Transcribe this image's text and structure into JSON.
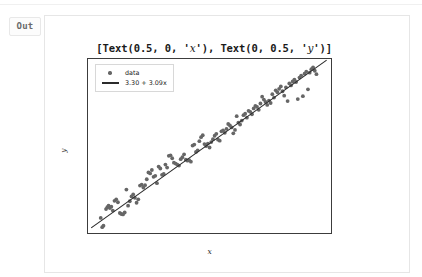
{
  "notebook": {
    "prompt_label": "Out",
    "output_text_prefix": "[Text(0.5, 0, '",
    "output_text_mid": "'), Text(0, 0.5, '",
    "output_text_suffix": "')]",
    "output_var_x": "x",
    "output_var_y": "y",
    "output_text_full": "[Text(0.5, 0, 'x'), Text(0, 0.5, 'y')]"
  },
  "chart_data": {
    "type": "scatter",
    "title": "",
    "xlabel": "x",
    "ylabel": "y",
    "xlim": [
      -0.55,
      11.0
    ],
    "ylim": [
      0.6,
      36.6
    ],
    "grid": false,
    "legend_position": "upper left",
    "xticks": [
      0,
      2,
      4,
      6,
      8,
      10
    ],
    "yticks": [
      5,
      10,
      15,
      20,
      25,
      30,
      35
    ],
    "xtick_labels": [
      "0",
      "2",
      "4",
      "6",
      "8",
      "10"
    ],
    "ytick_labels": [
      "5",
      "10",
      "15",
      "20",
      "25",
      "30",
      "35"
    ],
    "marker_color": "#666666",
    "line_color": "#2b2b2b",
    "series": [
      {
        "name": "data",
        "type": "scatter",
        "points": [
          [
            0.05,
            4.1
          ],
          [
            0.12,
            2.2
          ],
          [
            0.18,
            2.5
          ],
          [
            0.3,
            5.9
          ],
          [
            0.36,
            6.3
          ],
          [
            0.42,
            6.6
          ],
          [
            0.48,
            6.1
          ],
          [
            0.55,
            6.4
          ],
          [
            0.62,
            5.6
          ],
          [
            0.7,
            7.6
          ],
          [
            0.78,
            7.9
          ],
          [
            0.86,
            7.3
          ],
          [
            0.95,
            5.1
          ],
          [
            1.02,
            4.9
          ],
          [
            1.1,
            4.8
          ],
          [
            1.18,
            5.2
          ],
          [
            1.26,
            9.9
          ],
          [
            1.34,
            6.6
          ],
          [
            1.42,
            7.5
          ],
          [
            1.5,
            8.5
          ],
          [
            1.58,
            8.9
          ],
          [
            1.66,
            8.2
          ],
          [
            1.74,
            7.2
          ],
          [
            1.82,
            7.9
          ],
          [
            1.9,
            10.7
          ],
          [
            1.98,
            10.9
          ],
          [
            2.06,
            10.3
          ],
          [
            2.14,
            10.8
          ],
          [
            2.22,
            12.0
          ],
          [
            2.3,
            13.4
          ],
          [
            2.38,
            13.2
          ],
          [
            2.46,
            13.9
          ],
          [
            2.54,
            12.5
          ],
          [
            2.62,
            12.7
          ],
          [
            2.7,
            11.2
          ],
          [
            2.78,
            14.6
          ],
          [
            2.86,
            14.2
          ],
          [
            2.94,
            12.9
          ],
          [
            3.02,
            13.1
          ],
          [
            3.1,
            15.0
          ],
          [
            3.18,
            14.4
          ],
          [
            3.26,
            16.8
          ],
          [
            3.34,
            16.9
          ],
          [
            3.42,
            16.3
          ],
          [
            3.5,
            15.4
          ],
          [
            3.58,
            15.2
          ],
          [
            3.66,
            15.0
          ],
          [
            3.74,
            14.8
          ],
          [
            3.82,
            16.1
          ],
          [
            3.9,
            16.5
          ],
          [
            3.98,
            17.1
          ],
          [
            4.06,
            16.0
          ],
          [
            4.14,
            15.8
          ],
          [
            4.22,
            15.9
          ],
          [
            4.3,
            15.6
          ],
          [
            4.38,
            18.9
          ],
          [
            4.46,
            19.1
          ],
          [
            4.54,
            17.6
          ],
          [
            4.62,
            17.9
          ],
          [
            4.7,
            19.8
          ],
          [
            4.78,
            20.6
          ],
          [
            4.86,
            21.0
          ],
          [
            4.94,
            19.2
          ],
          [
            5.02,
            18.8
          ],
          [
            5.1,
            19.3
          ],
          [
            5.18,
            18.5
          ],
          [
            5.26,
            19.6
          ],
          [
            5.34,
            20.2
          ],
          [
            5.42,
            20.9
          ],
          [
            5.5,
            21.3
          ],
          [
            5.58,
            20.1
          ],
          [
            5.66,
            19.9
          ],
          [
            5.74,
            21.8
          ],
          [
            5.82,
            22.0
          ],
          [
            5.9,
            21.5
          ],
          [
            5.98,
            22.3
          ],
          [
            6.06,
            23.3
          ],
          [
            6.14,
            23.0
          ],
          [
            6.22,
            22.6
          ],
          [
            6.3,
            21.4
          ],
          [
            6.38,
            22.1
          ],
          [
            6.46,
            24.9
          ],
          [
            6.54,
            23.6
          ],
          [
            6.62,
            23.2
          ],
          [
            6.7,
            24.0
          ],
          [
            6.78,
            25.1
          ],
          [
            6.86,
            25.4
          ],
          [
            6.94,
            24.6
          ],
          [
            7.02,
            26.0
          ],
          [
            7.1,
            25.8
          ],
          [
            7.18,
            25.3
          ],
          [
            7.26,
            26.5
          ],
          [
            7.34,
            27.0
          ],
          [
            7.42,
            26.8
          ],
          [
            7.5,
            26.2
          ],
          [
            7.58,
            27.5
          ],
          [
            7.66,
            28.9
          ],
          [
            7.74,
            28.3
          ],
          [
            7.82,
            27.8
          ],
          [
            7.9,
            27.2
          ],
          [
            7.98,
            28.1
          ],
          [
            8.06,
            27.6
          ],
          [
            8.14,
            29.4
          ],
          [
            8.22,
            28.7
          ],
          [
            8.3,
            30.2
          ],
          [
            8.38,
            29.8
          ],
          [
            8.46,
            30.5
          ],
          [
            8.54,
            31.0
          ],
          [
            8.62,
            30.0
          ],
          [
            8.7,
            29.1
          ],
          [
            8.78,
            30.8
          ],
          [
            8.86,
            28.0
          ],
          [
            8.94,
            31.6
          ],
          [
            9.02,
            31.2
          ],
          [
            9.1,
            32.0
          ],
          [
            9.18,
            32.4
          ],
          [
            9.26,
            31.9
          ],
          [
            9.34,
            28.4
          ],
          [
            9.42,
            32.8
          ],
          [
            9.5,
            33.2
          ],
          [
            9.58,
            29.0
          ],
          [
            9.66,
            33.6
          ],
          [
            9.74,
            34.0
          ],
          [
            9.82,
            30.4
          ],
          [
            9.9,
            33.8
          ],
          [
            9.98,
            34.5
          ],
          [
            10.06,
            34.9
          ],
          [
            10.14,
            34.2
          ],
          [
            10.22,
            33.5
          ]
        ]
      },
      {
        "name": "3.30 + 3.09x",
        "type": "line",
        "slope": 3.09,
        "intercept": 3.3,
        "x_start": -0.4,
        "x_end": 10.7
      }
    ],
    "legend_entries": [
      {
        "label": "data",
        "key": "marker"
      },
      {
        "label": "3.30 + 3.09x",
        "key": "line"
      }
    ]
  }
}
